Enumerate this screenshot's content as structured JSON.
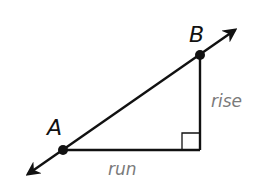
{
  "diagram": {
    "points": [
      {
        "label": "A",
        "x": 63,
        "y": 150
      },
      {
        "label": "B",
        "x": 200,
        "y": 55
      }
    ],
    "right_angle_vertex": {
      "x": 200,
      "y": 150
    },
    "segment_labels": {
      "vertical": "rise",
      "horizontal": "run"
    },
    "colors": {
      "line": "#111111",
      "segment_label": "#7a7a7a"
    }
  }
}
